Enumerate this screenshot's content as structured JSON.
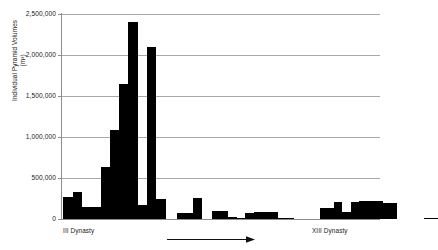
{
  "chart_data": {
    "type": "bar",
    "title": "",
    "subtitle": "",
    "ylabel": "Individual Pyramid Volumes (m³)",
    "ylabel_line1": "Individual Pyramid Volumes",
    "ylabel_line2": "(m³)",
    "xlabel": "",
    "ylim": [
      0,
      2500000
    ],
    "grid": true,
    "legend": null,
    "bar_color": "#000000",
    "gridline_color": "#a8a8a8",
    "axis_color": "#8d8d8d",
    "y_ticks": [
      0,
      500000,
      1000000,
      1500000,
      2000000,
      2500000
    ],
    "y_tick_labels": [
      "0",
      "500,000",
      "1,000,000",
      "1,500,000",
      "2,000,000",
      "2,500,000"
    ],
    "x_tick_labels": [
      "III Dynasty",
      "XIII Dynasty"
    ],
    "annotations": [
      {
        "name": "time-direction-arrow",
        "text": "",
        "direction": "right"
      }
    ],
    "categories": [
      "p1",
      "p2",
      "p3",
      "p4",
      "p5",
      "p6",
      "p7",
      "p8",
      "p9",
      "p10",
      "p11",
      "p12",
      "p13",
      "p14",
      "p15",
      "p16",
      "p17",
      "p18",
      "p19",
      "p20",
      "p21",
      "p22",
      "p23",
      "p24",
      "p25",
      "p26",
      "p27",
      "p28",
      "p29",
      "p30",
      "p31",
      "p32",
      "p33",
      "p34",
      "p35",
      "p36",
      "p37",
      "p38",
      "p39",
      "p40",
      "p41",
      "p42",
      "p43",
      "p44",
      "p45",
      "p46",
      "p47",
      "p48",
      "p49",
      "p50",
      "p51",
      "p52",
      "p53",
      "p54"
    ],
    "values": [
      270000,
      330000,
      150000,
      150000,
      640000,
      1090000,
      1650000,
      2400000,
      170000,
      2100000,
      240000,
      0,
      0,
      0,
      70000,
      70000,
      260000,
      0,
      0,
      0,
      100000,
      95000,
      20000,
      15000,
      75000,
      90000,
      85000,
      85000,
      5000,
      5000,
      0,
      0,
      0,
      0,
      130000,
      205000,
      85000,
      205000,
      215000,
      225000,
      215000,
      195000,
      195000,
      0,
      0,
      0,
      0,
      0,
      0,
      0,
      0,
      15000,
      15000,
      0
    ]
  },
  "bars": [
    {
      "x": 1,
      "w": 10,
      "v": 270000
    },
    {
      "x": 11,
      "w": 9,
      "v": 330000
    },
    {
      "x": 20,
      "w": 10,
      "v": 150000
    },
    {
      "x": 30,
      "w": 9,
      "v": 150000
    },
    {
      "x": 39,
      "w": 9,
      "v": 640000
    },
    {
      "x": 48,
      "w": 9,
      "v": 1090000
    },
    {
      "x": 57,
      "w": 9,
      "v": 1650000
    },
    {
      "x": 66,
      "w": 10,
      "v": 2400000
    },
    {
      "x": 76,
      "w": 9,
      "v": 170000
    },
    {
      "x": 85,
      "w": 9,
      "v": 2100000
    },
    {
      "x": 94,
      "w": 10,
      "v": 240000
    },
    {
      "x": 115,
      "w": 16,
      "v": 70000
    },
    {
      "x": 131,
      "w": 9,
      "v": 260000
    },
    {
      "x": 150,
      "w": 16,
      "v": 100000
    },
    {
      "x": 166,
      "w": 9,
      "v": 20000
    },
    {
      "x": 175,
      "w": 8,
      "v": 15000
    },
    {
      "x": 183,
      "w": 9,
      "v": 75000
    },
    {
      "x": 192,
      "w": 24,
      "v": 90000
    },
    {
      "x": 216,
      "w": 16,
      "v": 5000
    },
    {
      "x": 258,
      "w": 14,
      "v": 130000
    },
    {
      "x": 272,
      "w": 8,
      "v": 205000
    },
    {
      "x": 280,
      "w": 9,
      "v": 85000
    },
    {
      "x": 289,
      "w": 8,
      "v": 205000
    },
    {
      "x": 297,
      "w": 8,
      "v": 215000
    },
    {
      "x": 305,
      "w": 9,
      "v": 225000
    },
    {
      "x": 314,
      "w": 7,
      "v": 215000
    },
    {
      "x": 321,
      "w": 14,
      "v": 195000
    },
    {
      "x": 362,
      "w": 14,
      "v": 15000
    }
  ]
}
